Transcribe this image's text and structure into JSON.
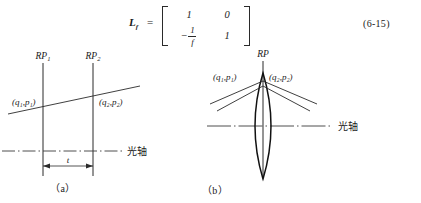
{
  "equation": {
    "lhs_symbol": "L",
    "lhs_subscript": "f",
    "equals": "=",
    "matrix": [
      [
        "1",
        "0"
      ],
      [
        "-1/f",
        "1"
      ]
    ],
    "cell_r1c1": "1",
    "cell_r1c2": "0",
    "cell_r2c1_sign": "−",
    "cell_r2c1_num": "1",
    "cell_r2c1_den": "f",
    "cell_r2c2": "1",
    "number": "(6-15)"
  },
  "figure_a": {
    "caption": "（a）",
    "plane1_label": "RP",
    "plane1_sub": "1",
    "plane2_label": "RP",
    "plane2_sub": "2",
    "ray_in_label": "(q₁,p₁)",
    "ray_out_label": "(q₂,p₂)",
    "axis_label": "光轴",
    "distance_label": "t"
  },
  "figure_b": {
    "caption": "（b）",
    "plane_label": "RP",
    "ray_in_label": "(q₁,p₁)",
    "ray_out_label": "(q₂,p₂)",
    "axis_label": "光轴"
  },
  "colors": {
    "ink": "#1a1a1a",
    "line": "#2a2a2a",
    "axis": "#3a3a3a",
    "background": "#ffffff"
  }
}
